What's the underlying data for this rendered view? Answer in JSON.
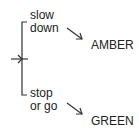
{
  "diagram": {
    "top_label": {
      "line1": "slow",
      "line2": "down"
    },
    "bottom_label": {
      "line1": "stop",
      "line2": "or go"
    },
    "top_target": "AMBER",
    "bottom_target": "GREEN",
    "icons": {
      "input_arrow": "right-arrow-icon",
      "top_arrow": "diagonal-arrow-icon",
      "bottom_arrow": "diagonal-arrow-icon"
    },
    "colors": {
      "line": "#333333",
      "text": "#222222",
      "background": "#ffffff"
    }
  }
}
